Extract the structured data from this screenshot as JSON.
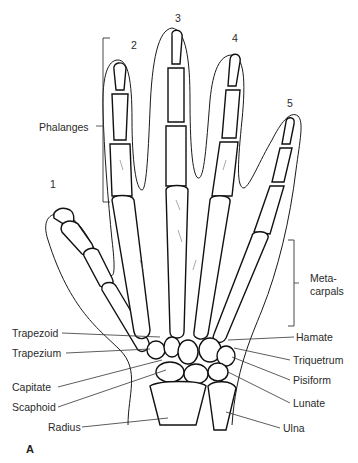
{
  "figure": {
    "panel_label": "A",
    "digit_numbers": [
      "1",
      "2",
      "3",
      "4",
      "5"
    ],
    "group_labels": {
      "phalanges": "Phalanges",
      "metacarpals_line1": "Meta-",
      "metacarpals_line2": "carpals"
    },
    "left_labels": [
      "Trapezoid",
      "Trapezium",
      "Capitate",
      "Scaphoid",
      "Radius"
    ],
    "right_labels": [
      "Hamate",
      "Triquetrum",
      "Pisiform",
      "Lunate",
      "Ulna"
    ]
  }
}
